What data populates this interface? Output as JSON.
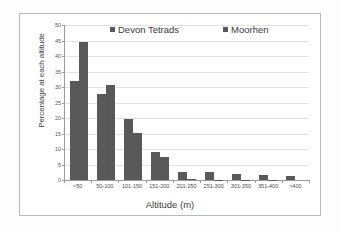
{
  "chart_data": {
    "type": "bar",
    "title": "",
    "xlabel": "Altitude (m)",
    "ylabel": "Percentage at each altitude",
    "ylim": [
      0,
      50
    ],
    "ytick_step": 5,
    "yticks": [
      "0",
      "5",
      "10",
      "15",
      "20",
      "25",
      "30",
      "35",
      "40",
      "45",
      "50"
    ],
    "grid": true,
    "legend_position": "top-center",
    "categories": [
      "<50",
      "50-100",
      "101-150",
      "151-200",
      "201-250",
      "251-300",
      "301-350",
      "351-400",
      ">400"
    ],
    "series": [
      {
        "name": "Devon Tetrads",
        "color": "#595959",
        "values": [
          32.0,
          27.7,
          19.8,
          8.9,
          2.5,
          2.5,
          2.0,
          1.5,
          1.2
        ]
      },
      {
        "name": "Moorhen",
        "color": "#585858",
        "values": [
          44.5,
          30.5,
          15.1,
          7.5,
          0.2,
          0.15,
          0.1,
          0.1,
          0.0
        ]
      }
    ]
  },
  "legend": {
    "items": [
      {
        "label": "Devon Tetrads",
        "marker": "square-marker"
      },
      {
        "label": "Moorhen",
        "marker": "square-marker"
      }
    ]
  },
  "colors": {
    "bar": "#595959",
    "gridline": "#e2e2e2",
    "axis": "#9a9a9a",
    "frame": "#b9b9b9",
    "text": "#3d3d3d",
    "background": "#ffffff"
  }
}
